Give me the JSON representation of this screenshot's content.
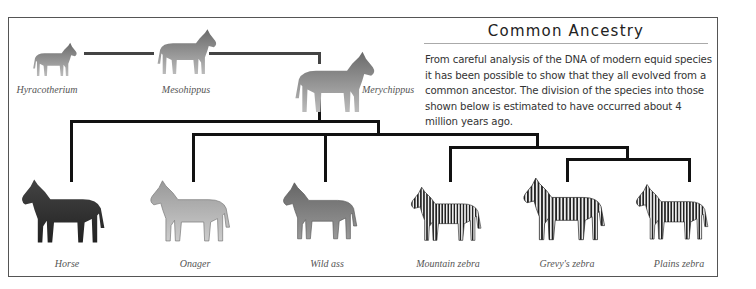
{
  "title": "Common Ancestry",
  "description": "From careful analysis of the DNA of modern equid species it has been possible to show that they all evolved from a common ancestor. The division of the species into those shown below is estimated to have occurred about 4 million years ago.",
  "ancestors": [
    {
      "name": "Hyracotherium"
    },
    {
      "name": "Mesohippus"
    },
    {
      "name": "Merychippus"
    }
  ],
  "species": [
    {
      "name": "Horse"
    },
    {
      "name": "Onager"
    },
    {
      "name": "Wild ass"
    },
    {
      "name": "Mountain zebra"
    },
    {
      "name": "Grevy's zebra"
    },
    {
      "name": "Plains zebra"
    }
  ],
  "colors": {
    "line": "#111111",
    "frame": "#555555",
    "label": "#555555"
  }
}
